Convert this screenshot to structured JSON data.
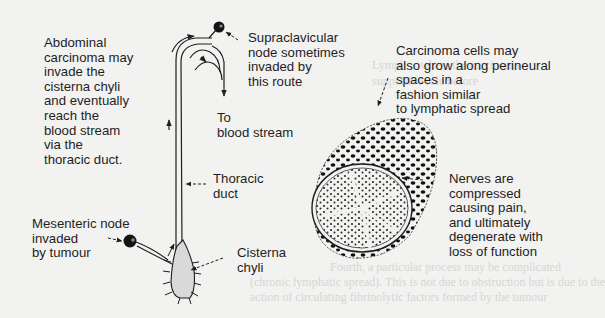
{
  "diagram": {
    "labels": {
      "abdominal": "Abdominal\ncarcinoma may\ninvade the\ncisterna chyli\nand eventually\nreach the\nblood stream\nvia the\nthoracic duct.",
      "supraclavicular": "Supraclavicular\nnode sometimes\ninvaded by\nthis route",
      "to_blood": "To\nblood stream",
      "thoracic_duct": "Thoracic\nduct",
      "mesenteric": "Mesenteric node\ninvaded\nby tumour",
      "cisterna": "Cisterna\nchyli",
      "perineural": "Carcinoma cells may\nalso grow along perineural\nspaces in a\nfashion similar\nto lymphatic spread",
      "nerves": "Nerves are\ncompressed\ncausing pain,\nand ultimately\ndegenerate with\nloss of function"
    },
    "icons": [
      "lymph-node-icon",
      "arrow-icon",
      "nerve-cross-section-icon"
    ],
    "colors": {
      "background": "#f2f2f0",
      "ink": "#1e1e1e",
      "cisterna_fill": "#d9d9d9"
    }
  },
  "bleed_through": {
    "line1": "Lymph is where the carcinoma",
    "line2": "supportive role before",
    "line3": "Fourth, a particular process may be complicated",
    "line4": "(chronic lymphatic spread). This is not due to obstruction but is due to the",
    "line5": "action of circulating fibrinolytic factors formed by the tumour"
  }
}
